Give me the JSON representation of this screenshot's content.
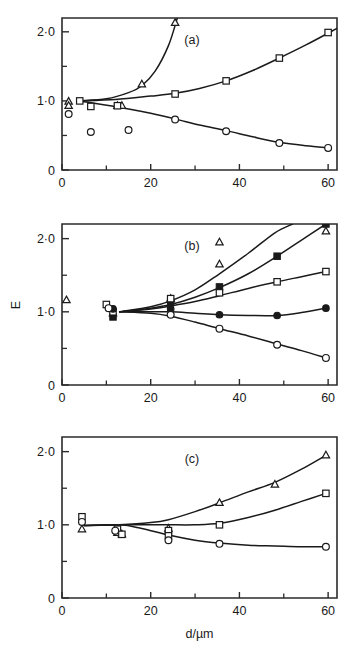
{
  "figure": {
    "axis_labels": {
      "x": "d/µm",
      "y": "E"
    },
    "x_ticks_major": [
      "0",
      "20",
      "40",
      "60"
    ],
    "x_ticks_major_values": [
      0,
      20,
      40,
      60
    ],
    "x_ticks_minor_values": [
      10,
      30,
      50
    ],
    "y_ticks_major": [
      "0",
      "1·0",
      "2·0"
    ],
    "y_ticks_major_values": [
      0,
      1.0,
      2.0
    ],
    "y_ticks_minor_values": [
      0.5,
      1.5
    ],
    "xlim": [
      0,
      62
    ],
    "ylim": [
      0,
      2.2
    ]
  },
  "chart_data": [
    {
      "type": "scatter",
      "panel": "(a)",
      "title": "(a)",
      "xlabel": "d/µm",
      "ylabel": "E",
      "xlim": [
        0,
        62
      ],
      "ylim": [
        0,
        2.2
      ],
      "grid": false,
      "legend": "none",
      "series": [
        {
          "name": "open-triangle",
          "marker": "triangle-open",
          "points": [
            {
              "x": 1.5,
              "y": 0.99
            },
            {
              "x": 1.5,
              "y": 0.93
            },
            {
              "x": 12.5,
              "y": 0.93
            },
            {
              "x": 13.5,
              "y": 0.93
            },
            {
              "x": 18.0,
              "y": 1.24
            },
            {
              "x": 25.5,
              "y": 2.13
            }
          ],
          "curve": [
            {
              "x": 4.0,
              "y": 1.0
            },
            {
              "x": 10.0,
              "y": 1.03
            },
            {
              "x": 15.0,
              "y": 1.12
            },
            {
              "x": 18.0,
              "y": 1.22
            },
            {
              "x": 21.0,
              "y": 1.43
            },
            {
              "x": 24.0,
              "y": 1.8
            },
            {
              "x": 26.0,
              "y": 2.2
            }
          ]
        },
        {
          "name": "open-square",
          "marker": "square-open",
          "points": [
            {
              "x": 4.0,
              "y": 1.0
            },
            {
              "x": 6.5,
              "y": 0.92
            },
            {
              "x": 12.5,
              "y": 0.93
            },
            {
              "x": 25.5,
              "y": 1.1
            },
            {
              "x": 37.0,
              "y": 1.29
            },
            {
              "x": 49.0,
              "y": 1.62
            },
            {
              "x": 60.0,
              "y": 1.99
            }
          ],
          "curve": [
            {
              "x": 4.0,
              "y": 1.0
            },
            {
              "x": 12.0,
              "y": 1.02
            },
            {
              "x": 20.0,
              "y": 1.07
            },
            {
              "x": 25.5,
              "y": 1.11
            },
            {
              "x": 31.0,
              "y": 1.18
            },
            {
              "x": 37.0,
              "y": 1.29
            },
            {
              "x": 43.0,
              "y": 1.44
            },
            {
              "x": 49.0,
              "y": 1.62
            },
            {
              "x": 55.0,
              "y": 1.81
            },
            {
              "x": 62.0,
              "y": 2.05
            }
          ]
        },
        {
          "name": "open-circle",
          "marker": "circle-open",
          "points": [
            {
              "x": 1.5,
              "y": 0.81
            },
            {
              "x": 6.5,
              "y": 0.55
            },
            {
              "x": 15.0,
              "y": 0.58
            },
            {
              "x": 25.5,
              "y": 0.73
            },
            {
              "x": 37.0,
              "y": 0.56
            },
            {
              "x": 49.0,
              "y": 0.39
            },
            {
              "x": 60.0,
              "y": 0.32
            }
          ],
          "curve": [
            {
              "x": 4.0,
              "y": 1.0
            },
            {
              "x": 12.0,
              "y": 0.92
            },
            {
              "x": 20.0,
              "y": 0.82
            },
            {
              "x": 25.5,
              "y": 0.74
            },
            {
              "x": 31.0,
              "y": 0.65
            },
            {
              "x": 37.0,
              "y": 0.57
            },
            {
              "x": 43.0,
              "y": 0.48
            },
            {
              "x": 49.0,
              "y": 0.4
            },
            {
              "x": 55.0,
              "y": 0.35
            },
            {
              "x": 60.0,
              "y": 0.32
            }
          ]
        }
      ]
    },
    {
      "type": "scatter",
      "panel": "(b)",
      "title": "(b)",
      "xlabel": "d/µm",
      "ylabel": "E",
      "xlim": [
        0,
        62
      ],
      "ylim": [
        0,
        2.2
      ],
      "grid": false,
      "legend": "none",
      "series": [
        {
          "name": "open-triangle-upper",
          "marker": "triangle-open",
          "points": [
            {
              "x": 1.0,
              "y": 1.16
            },
            {
              "x": 11.5,
              "y": 0.98
            },
            {
              "x": 24.5,
              "y": 1.18
            },
            {
              "x": 35.5,
              "y": 1.65
            },
            {
              "x": 35.5,
              "y": 1.95
            },
            {
              "x": 59.5,
              "y": 2.1
            }
          ],
          "curve": [
            {
              "x": 13.0,
              "y": 1.0
            },
            {
              "x": 20.0,
              "y": 1.07
            },
            {
              "x": 24.5,
              "y": 1.15
            },
            {
              "x": 30.0,
              "y": 1.3
            },
            {
              "x": 35.5,
              "y": 1.52
            },
            {
              "x": 42.0,
              "y": 1.8
            },
            {
              "x": 48.0,
              "y": 2.08
            },
            {
              "x": 52.0,
              "y": 2.2
            }
          ]
        },
        {
          "name": "filled-square",
          "marker": "square-filled",
          "points": [
            {
              "x": 11.5,
              "y": 0.93
            },
            {
              "x": 24.5,
              "y": 1.13
            },
            {
              "x": 35.5,
              "y": 1.34
            },
            {
              "x": 48.5,
              "y": 1.76
            },
            {
              "x": 59.5,
              "y": 2.2
            }
          ],
          "curve": [
            {
              "x": 13.0,
              "y": 1.0
            },
            {
              "x": 20.0,
              "y": 1.05
            },
            {
              "x": 24.5,
              "y": 1.1
            },
            {
              "x": 30.0,
              "y": 1.2
            },
            {
              "x": 35.5,
              "y": 1.33
            },
            {
              "x": 42.0,
              "y": 1.52
            },
            {
              "x": 48.5,
              "y": 1.76
            },
            {
              "x": 54.0,
              "y": 1.98
            },
            {
              "x": 59.5,
              "y": 2.2
            }
          ]
        },
        {
          "name": "open-square",
          "marker": "square-open",
          "points": [
            {
              "x": 10.0,
              "y": 1.1
            },
            {
              "x": 11.5,
              "y": 1.0
            },
            {
              "x": 24.5,
              "y": 1.18
            },
            {
              "x": 35.5,
              "y": 1.26
            },
            {
              "x": 48.5,
              "y": 1.41
            },
            {
              "x": 59.5,
              "y": 1.55
            }
          ],
          "curve": [
            {
              "x": 13.0,
              "y": 1.0
            },
            {
              "x": 20.0,
              "y": 1.04
            },
            {
              "x": 24.5,
              "y": 1.08
            },
            {
              "x": 30.0,
              "y": 1.14
            },
            {
              "x": 35.5,
              "y": 1.22
            },
            {
              "x": 42.0,
              "y": 1.32
            },
            {
              "x": 48.5,
              "y": 1.41
            },
            {
              "x": 54.0,
              "y": 1.48
            },
            {
              "x": 59.5,
              "y": 1.55
            }
          ]
        },
        {
          "name": "filled-circle",
          "marker": "circle-filled",
          "points": [
            {
              "x": 11.5,
              "y": 1.04
            },
            {
              "x": 24.5,
              "y": 1.04
            },
            {
              "x": 35.5,
              "y": 0.96
            },
            {
              "x": 48.5,
              "y": 0.95
            },
            {
              "x": 59.5,
              "y": 1.05
            }
          ],
          "curve": [
            {
              "x": 13.0,
              "y": 1.0
            },
            {
              "x": 20.0,
              "y": 1.0
            },
            {
              "x": 24.5,
              "y": 1.0
            },
            {
              "x": 30.0,
              "y": 0.98
            },
            {
              "x": 35.5,
              "y": 0.96
            },
            {
              "x": 42.0,
              "y": 0.95
            },
            {
              "x": 48.5,
              "y": 0.95
            },
            {
              "x": 54.0,
              "y": 0.99
            },
            {
              "x": 59.5,
              "y": 1.05
            }
          ]
        },
        {
          "name": "open-circle",
          "marker": "circle-open",
          "points": [
            {
              "x": 10.5,
              "y": 1.05
            },
            {
              "x": 24.5,
              "y": 0.96
            },
            {
              "x": 35.5,
              "y": 0.77
            },
            {
              "x": 48.5,
              "y": 0.55
            },
            {
              "x": 59.5,
              "y": 0.37
            }
          ],
          "curve": [
            {
              "x": 13.0,
              "y": 1.0
            },
            {
              "x": 20.0,
              "y": 0.98
            },
            {
              "x": 24.5,
              "y": 0.94
            },
            {
              "x": 30.0,
              "y": 0.86
            },
            {
              "x": 35.5,
              "y": 0.77
            },
            {
              "x": 42.0,
              "y": 0.67
            },
            {
              "x": 48.5,
              "y": 0.56
            },
            {
              "x": 54.0,
              "y": 0.47
            },
            {
              "x": 59.5,
              "y": 0.37
            }
          ]
        }
      ]
    },
    {
      "type": "scatter",
      "panel": "(c)",
      "title": "(c)",
      "xlabel": "d/µm",
      "ylabel": "E",
      "xlim": [
        0,
        62
      ],
      "ylim": [
        0,
        2.2
      ],
      "grid": false,
      "legend": "none",
      "series": [
        {
          "name": "open-triangle",
          "marker": "triangle-open",
          "points": [
            {
              "x": 4.5,
              "y": 0.94
            },
            {
              "x": 12.5,
              "y": 0.89
            },
            {
              "x": 13.5,
              "y": 0.87
            },
            {
              "x": 24.0,
              "y": 0.95
            },
            {
              "x": 35.5,
              "y": 1.3
            },
            {
              "x": 48.0,
              "y": 1.55
            },
            {
              "x": 59.5,
              "y": 1.95
            }
          ],
          "curve": [
            {
              "x": 5.0,
              "y": 0.99
            },
            {
              "x": 13.0,
              "y": 1.0
            },
            {
              "x": 20.0,
              "y": 1.03
            },
            {
              "x": 24.0,
              "y": 1.07
            },
            {
              "x": 30.0,
              "y": 1.18
            },
            {
              "x": 35.5,
              "y": 1.3
            },
            {
              "x": 42.0,
              "y": 1.45
            },
            {
              "x": 48.0,
              "y": 1.58
            },
            {
              "x": 54.0,
              "y": 1.76
            },
            {
              "x": 59.5,
              "y": 1.95
            }
          ]
        },
        {
          "name": "open-square",
          "marker": "square-open",
          "points": [
            {
              "x": 4.5,
              "y": 1.11
            },
            {
              "x": 12.5,
              "y": 0.94
            },
            {
              "x": 13.5,
              "y": 0.87
            },
            {
              "x": 24.0,
              "y": 0.92
            },
            {
              "x": 24.0,
              "y": 0.85
            },
            {
              "x": 35.5,
              "y": 1.0
            },
            {
              "x": 59.5,
              "y": 1.43
            }
          ],
          "curve": [
            {
              "x": 5.0,
              "y": 0.99
            },
            {
              "x": 13.0,
              "y": 1.0
            },
            {
              "x": 20.0,
              "y": 1.0
            },
            {
              "x": 24.0,
              "y": 1.0
            },
            {
              "x": 30.0,
              "y": 1.0
            },
            {
              "x": 35.5,
              "y": 1.02
            },
            {
              "x": 42.0,
              "y": 1.1
            },
            {
              "x": 48.0,
              "y": 1.2
            },
            {
              "x": 54.0,
              "y": 1.32
            },
            {
              "x": 59.5,
              "y": 1.43
            }
          ]
        },
        {
          "name": "open-circle",
          "marker": "circle-open",
          "points": [
            {
              "x": 4.5,
              "y": 1.04
            },
            {
              "x": 12.0,
              "y": 0.92
            },
            {
              "x": 24.0,
              "y": 0.79
            },
            {
              "x": 35.5,
              "y": 0.74
            },
            {
              "x": 59.5,
              "y": 0.7
            }
          ],
          "curve": [
            {
              "x": 5.0,
              "y": 0.99
            },
            {
              "x": 13.0,
              "y": 1.0
            },
            {
              "x": 18.0,
              "y": 0.95
            },
            {
              "x": 24.0,
              "y": 0.86
            },
            {
              "x": 30.0,
              "y": 0.79
            },
            {
              "x": 35.5,
              "y": 0.75
            },
            {
              "x": 42.0,
              "y": 0.72
            },
            {
              "x": 48.0,
              "y": 0.71
            },
            {
              "x": 54.0,
              "y": 0.7
            },
            {
              "x": 59.5,
              "y": 0.7
            }
          ]
        }
      ]
    }
  ]
}
